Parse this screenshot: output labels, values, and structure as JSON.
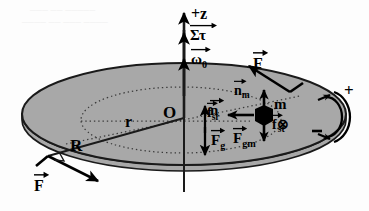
{
  "figure": {
    "bg_color": "#fdfdfd",
    "disk_fill": "#a8a8a8",
    "disk_stroke": "#1a1a1a",
    "ink": "#000000"
  },
  "axis": {
    "name": "z-axis",
    "top_label": "+z",
    "torque_label": "Στ",
    "omega_label": "ω",
    "omega_sub": "0"
  },
  "disk": {
    "center_label": "O",
    "radius_label": "R",
    "inner_radius_label": "r",
    "normal_label": "n",
    "gravity_label": "F",
    "gravity_sub": "g"
  },
  "mass": {
    "label": "m",
    "normal_label": "n",
    "normal_sub": "m",
    "f_radial_label": "f",
    "f_radial_sub": "sr",
    "f_tangential_label": "f",
    "f_tangential_sub": "st",
    "f_gravity_label": "F",
    "f_gravity_sub": "gm",
    "into_page_symbol": "⊗"
  },
  "applied_forces": {
    "top_right_label": "F",
    "bottom_left_label": "F"
  },
  "rotation_sense": {
    "positive": "+",
    "negative": "−"
  },
  "bleed_through": {
    "line1": "─── ── ─────",
    "line2": "──── ── ─── ────"
  }
}
